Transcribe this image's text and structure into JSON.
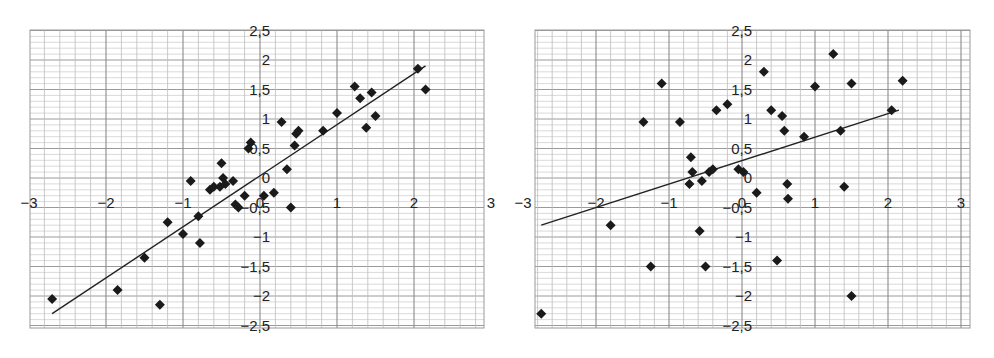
{
  "chart_data": [
    {
      "type": "scatter",
      "title": "",
      "xlabel": "",
      "ylabel": "",
      "xlim": [
        -3,
        3
      ],
      "ylim": [
        -2.5,
        2.5
      ],
      "grid": true,
      "x_ticks": [
        "-3",
        "-2",
        "-1",
        "0",
        "1",
        "2",
        "3"
      ],
      "y_ticks": [
        "2,5",
        "2",
        "1,5",
        "1",
        "0,5",
        "0",
        "-0,5",
        "-1",
        "-1,5",
        "-2",
        "-2,5"
      ],
      "marker": "diamond",
      "points": [
        [
          -2.7,
          -2.05
        ],
        [
          -1.85,
          -1.9
        ],
        [
          -1.5,
          -1.35
        ],
        [
          -1.3,
          -2.15
        ],
        [
          -1.2,
          -0.75
        ],
        [
          -1.0,
          -0.95
        ],
        [
          -0.9,
          -0.05
        ],
        [
          -0.8,
          -0.65
        ],
        [
          -0.78,
          -1.1
        ],
        [
          -0.65,
          -0.2
        ],
        [
          -0.6,
          -0.15
        ],
        [
          -0.52,
          -0.15
        ],
        [
          -0.5,
          0.25
        ],
        [
          -0.48,
          0.0
        ],
        [
          -0.45,
          -0.1
        ],
        [
          -0.35,
          -0.05
        ],
        [
          -0.32,
          -0.45
        ],
        [
          -0.28,
          -0.5
        ],
        [
          -0.2,
          -0.3
        ],
        [
          -0.15,
          0.5
        ],
        [
          -0.12,
          0.6
        ],
        [
          0.05,
          -0.3
        ],
        [
          0.18,
          -0.25
        ],
        [
          0.28,
          0.95
        ],
        [
          0.35,
          0.15
        ],
        [
          0.4,
          -0.5
        ],
        [
          0.45,
          0.55
        ],
        [
          0.47,
          0.75
        ],
        [
          0.5,
          0.8
        ],
        [
          0.82,
          0.8
        ],
        [
          1.0,
          1.1
        ],
        [
          1.23,
          1.55
        ],
        [
          1.3,
          1.35
        ],
        [
          1.38,
          0.85
        ],
        [
          1.45,
          1.45
        ],
        [
          1.5,
          1.05
        ],
        [
          2.05,
          1.85
        ],
        [
          2.15,
          1.5
        ]
      ],
      "regression_line": {
        "x": [
          -2.7,
          2.15
        ],
        "y": [
          -2.3,
          1.9
        ]
      }
    },
    {
      "type": "scatter",
      "title": "",
      "xlabel": "",
      "ylabel": "",
      "xlim": [
        -3,
        3
      ],
      "ylim": [
        -2.5,
        2.5
      ],
      "grid": true,
      "x_ticks": [
        "-3",
        "-2",
        "-1",
        "0",
        "1",
        "2",
        "3"
      ],
      "y_ticks": [
        "2,5",
        "2",
        "1,5",
        "1",
        "0,5",
        "0",
        "-0,5",
        "-1",
        "-1,5",
        "-2",
        "-2,5"
      ],
      "marker": "diamond",
      "points": [
        [
          -2.75,
          -2.3
        ],
        [
          -1.8,
          -0.8
        ],
        [
          -1.25,
          -1.5
        ],
        [
          -1.1,
          1.6
        ],
        [
          -1.35,
          0.95
        ],
        [
          -0.85,
          0.95
        ],
        [
          -0.7,
          0.35
        ],
        [
          -0.68,
          0.1
        ],
        [
          -0.72,
          -0.1
        ],
        [
          -0.55,
          -0.05
        ],
        [
          -0.58,
          -0.9
        ],
        [
          -0.5,
          -1.5
        ],
        [
          -0.45,
          0.1
        ],
        [
          -0.4,
          0.15
        ],
        [
          -0.35,
          1.15
        ],
        [
          -0.2,
          1.25
        ],
        [
          -0.05,
          0.15
        ],
        [
          0.02,
          0.1
        ],
        [
          0.2,
          -0.25
        ],
        [
          0.3,
          1.8
        ],
        [
          0.4,
          1.15
        ],
        [
          0.48,
          -1.4
        ],
        [
          0.55,
          1.05
        ],
        [
          0.58,
          0.8
        ],
        [
          0.62,
          -0.1
        ],
        [
          0.63,
          -0.35
        ],
        [
          0.85,
          0.7
        ],
        [
          1.0,
          1.55
        ],
        [
          1.25,
          2.1
        ],
        [
          1.35,
          0.8
        ],
        [
          1.4,
          -0.15
        ],
        [
          1.5,
          1.6
        ],
        [
          1.5,
          -2.0
        ],
        [
          2.05,
          1.15
        ],
        [
          2.2,
          1.65
        ]
      ],
      "regression_line": {
        "x": [
          -2.75,
          2.15
        ],
        "y": [
          -0.8,
          1.15
        ]
      }
    }
  ]
}
